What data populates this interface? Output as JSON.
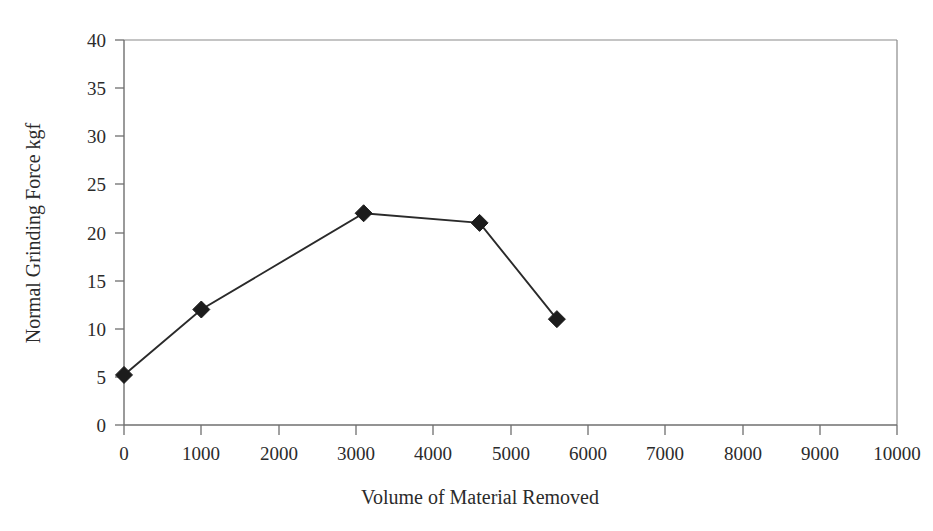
{
  "chart_data": {
    "type": "line",
    "title": "",
    "subtitle": "",
    "xlabel": "Volume of Material Removed",
    "ylabel": "Normal Grinding Force kgf",
    "xlim": [
      0,
      10000
    ],
    "ylim": [
      0,
      40
    ],
    "grid": false,
    "legend": "none",
    "x_ticks": [
      0,
      1000,
      2000,
      3000,
      4000,
      5000,
      6000,
      7000,
      8000,
      9000,
      10000
    ],
    "x_tick_labels": [
      "0",
      "1000",
      "2000",
      "3000",
      "4000",
      "5000",
      "6000",
      "7000",
      "8000",
      "9000",
      "10000"
    ],
    "y_ticks": [
      0,
      5,
      10,
      15,
      20,
      25,
      30,
      35,
      40
    ],
    "y_tick_labels": [
      "0",
      "5",
      "10",
      "15",
      "20",
      "25",
      "30",
      "35",
      "40"
    ],
    "series": [
      {
        "name": "Normal Grinding Force",
        "marker": "diamond",
        "color": "#1c1c1c",
        "x": [
          0,
          1000,
          3100,
          4600,
          5600
        ],
        "y": [
          5.2,
          12.0,
          22.0,
          21.0,
          11.0
        ]
      }
    ]
  },
  "figure": {
    "background_color": "#ffffff",
    "axis_color": "#6f6f6f",
    "frame_color": "#8a8a8a",
    "series_color": "#1c1c1c"
  }
}
